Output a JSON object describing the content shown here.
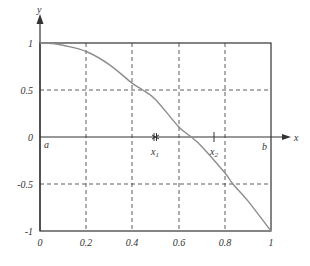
{
  "chart_data": {
    "type": "line",
    "title": "",
    "xlabel": "x",
    "ylabel": "y",
    "xlim": [
      0,
      1
    ],
    "ylim": [
      -1,
      1
    ],
    "grid": true,
    "grid_style": "dashed",
    "x_ticks": [
      "0",
      "0.2",
      "0.4",
      "0.6",
      "0.8",
      "1"
    ],
    "y_ticks": [
      "1",
      "0.5",
      "0",
      "-0.5",
      "-1"
    ],
    "series": [
      {
        "name": "f(x)",
        "color": "#8c8c8c",
        "x": [
          0,
          0.05,
          0.1,
          0.2,
          0.3,
          0.4,
          0.445,
          0.5,
          0.6,
          0.655,
          0.7,
          0.8,
          0.835,
          0.9,
          1.0
        ],
        "y": [
          1,
          0.995,
          0.975,
          0.91,
          0.77,
          0.57,
          0.5,
          0.4,
          0.11,
          0,
          -0.1,
          -0.38,
          -0.5,
          -0.68,
          -1
        ]
      }
    ],
    "annotations": [
      {
        "text": "a",
        "x": 0,
        "y": 0,
        "position": "below-right"
      },
      {
        "text": "b",
        "x": 1,
        "y": 0,
        "position": "below-left"
      },
      {
        "text": "x1",
        "x": 0.5,
        "y": 0,
        "marker": "double-tick"
      },
      {
        "text": "x2",
        "x": 0.75,
        "y": 0,
        "marker": "tick"
      }
    ]
  },
  "labels": {
    "y_axis": "y",
    "x_axis": "x",
    "a": "a",
    "b": "b",
    "x1": "x",
    "x1_sub": "1",
    "x2": "x",
    "x2_sub": "2",
    "y_ticks": [
      "1",
      "0.5",
      "0",
      "-0.5",
      "-1"
    ],
    "x_ticks": [
      "0",
      "0.2",
      "0.4",
      "0.6",
      "0.8",
      "1"
    ]
  }
}
